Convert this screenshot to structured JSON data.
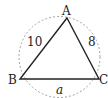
{
  "diagram": {
    "type": "triangle-inscribed-in-circle",
    "vertices": [
      {
        "label": "A",
        "x": 67,
        "y": 18
      },
      {
        "label": "B",
        "x": 20,
        "y": 79
      },
      {
        "label": "C",
        "x": 99,
        "y": 79
      }
    ],
    "sides": [
      {
        "name": "AB",
        "label": "10"
      },
      {
        "name": "AC",
        "label": "8"
      },
      {
        "name": "BC",
        "label": "a"
      }
    ],
    "circle": {
      "style": "dashed",
      "color": "#999999"
    },
    "colors": {
      "triangle": "#222222",
      "circle": "#9a9a9a",
      "text": "#222222"
    }
  }
}
